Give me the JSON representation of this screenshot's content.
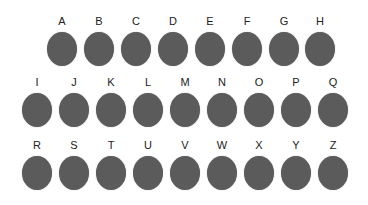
{
  "rows": [
    {
      "top": 15,
      "items": [
        {
          "label": "A",
          "x": 46
        },
        {
          "label": "B",
          "x": 83
        },
        {
          "label": "C",
          "x": 120
        },
        {
          "label": "D",
          "x": 157
        },
        {
          "label": "E",
          "x": 194
        },
        {
          "label": "F",
          "x": 231
        },
        {
          "label": "G",
          "x": 268
        },
        {
          "label": "H",
          "x": 304
        }
      ]
    },
    {
      "top": 76,
      "items": [
        {
          "label": "I",
          "x": 21
        },
        {
          "label": "J",
          "x": 58
        },
        {
          "label": "K",
          "x": 95
        },
        {
          "label": "L",
          "x": 132
        },
        {
          "label": "M",
          "x": 169
        },
        {
          "label": "N",
          "x": 206
        },
        {
          "label": "O",
          "x": 243
        },
        {
          "label": "P",
          "x": 280
        },
        {
          "label": "Q",
          "x": 317
        }
      ]
    },
    {
      "top": 139,
      "items": [
        {
          "label": "R",
          "x": 21
        },
        {
          "label": "S",
          "x": 58
        },
        {
          "label": "T",
          "x": 95
        },
        {
          "label": "U",
          "x": 132
        },
        {
          "label": "V",
          "x": 169
        },
        {
          "label": "W",
          "x": 206
        },
        {
          "label": "X",
          "x": 243
        },
        {
          "label": "Y",
          "x": 280
        },
        {
          "label": "Z",
          "x": 317
        }
      ]
    }
  ],
  "colors": {
    "dot": "#5b5b5b",
    "label": "#222222"
  }
}
